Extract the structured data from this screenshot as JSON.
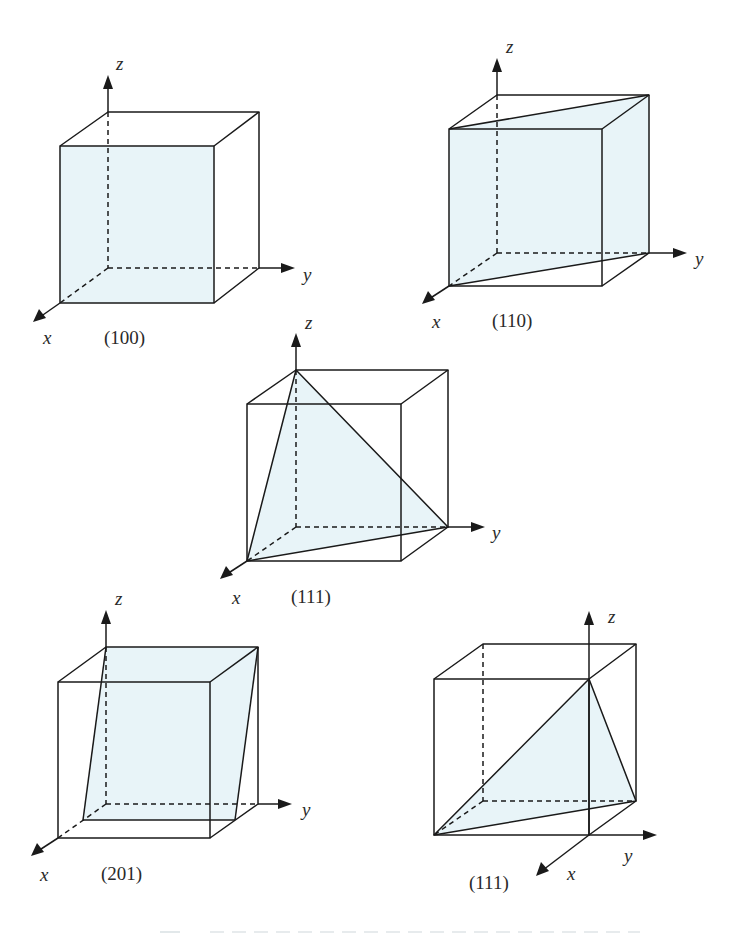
{
  "figure": {
    "plane_fill_color": "#e8f4f8",
    "line_color": "#1a1a1a",
    "panels": [
      {
        "id": "p100",
        "miller_index": "(100)",
        "axes": {
          "x": "x",
          "y": "y",
          "z": "z"
        },
        "description": "Front face of cube shaded"
      },
      {
        "id": "p110",
        "miller_index": "(110)",
        "axes": {
          "x": "x",
          "y": "y",
          "z": "z"
        },
        "description": "Diagonal plane through x and y intercepts, parallel to z"
      },
      {
        "id": "p111a",
        "miller_index": "(111)",
        "axes": {
          "x": "x",
          "y": "y",
          "z": "z"
        },
        "description": "Triangle intercepting x, y, z at unit distances"
      },
      {
        "id": "p201",
        "miller_index": "(201)",
        "axes": {
          "x": "x",
          "y": "y",
          "z": "z"
        },
        "description": "Plane intercepting x at 1/2 and z at 1, parallel to y"
      },
      {
        "id": "p111b",
        "miller_index": "(111)",
        "axes": {
          "x": "x",
          "y": "y",
          "z": "z"
        },
        "description": "(111) plane with origin moved to a different cube corner"
      }
    ]
  }
}
